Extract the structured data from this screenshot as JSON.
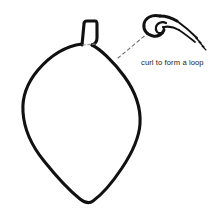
{
  "diagram": {
    "title": "curl to form a loop",
    "background_color": "#ffffff",
    "ink_color": "#111111",
    "caption": {
      "text": "curl to form a loop",
      "color": "#222222"
    },
    "parts": {
      "balloon_body": "balloon-body-outline",
      "balloon_neck": "balloon-neck",
      "neck_seam": "neck-seam-dashed-line",
      "leader_line": "leader-line-dashed",
      "curl_detail": "curled-loop-detail",
      "tail_strands": "tail-strands"
    }
  }
}
